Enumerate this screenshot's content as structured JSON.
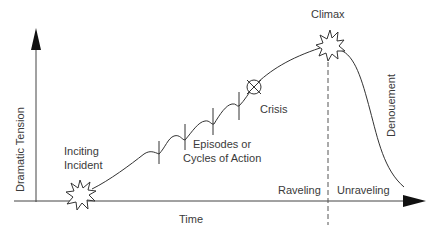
{
  "diagram": {
    "type": "dramatic-structure-curve",
    "axes": {
      "y_label": "Dramatic Tension",
      "x_label": "Time"
    },
    "labels": {
      "inciting_incident_line1": "Inciting",
      "inciting_incident_line2": "Incident",
      "episodes_line1": "Episodes or",
      "episodes_line2": "Cycles of Action",
      "crisis": "Crisis",
      "climax": "Climax",
      "denouement": "Denouement",
      "raveling": "Raveling",
      "unraveling": "Unraveling"
    },
    "colors": {
      "line": "#333333",
      "background": "#ffffff"
    }
  }
}
